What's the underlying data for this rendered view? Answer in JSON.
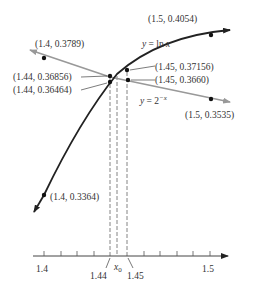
{
  "diagram": {
    "curves": [
      {
        "name": "ln",
        "label_prefix": "y = ",
        "label_expr": "ln x",
        "color": "#222222"
      },
      {
        "name": "exp2",
        "label_prefix": "y = ",
        "label_base": "2",
        "label_sup": "−x",
        "color": "#999999"
      }
    ],
    "points": {
      "p_ln_15": "(1.5, 0.4054)",
      "p_exp_14": "(1.4, 0.3789)",
      "p_ln_144": "(1.44, 0.36856)",
      "p_exp_144": "(1.44, 0.36464)",
      "p_ln_145": "(1.45, 0.37156)",
      "p_exp_145": "(1.45, 0.3660)",
      "p_exp_15": "(1.5, 0.3535)",
      "p_ln_14": "(1.4, 0.3364)"
    },
    "axis": {
      "tick_start": "1.4",
      "tick_end": "1.5",
      "mark_left": "1.44",
      "mark_root": "x",
      "mark_root_sub": "0",
      "mark_right": "1.45"
    }
  }
}
